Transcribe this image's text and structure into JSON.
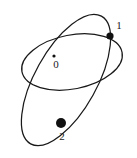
{
  "figure": {
    "background_color": "#ffffff",
    "stroke_color": "#191919",
    "dot_color": "#111111",
    "width": 137,
    "height": 158
  },
  "chart_data": {
    "type": "scatter",
    "title": "",
    "xlabel": "",
    "ylabel": "",
    "grid": false,
    "legend": false,
    "xlim": [
      0,
      137
    ],
    "ylim": [
      0,
      158
    ],
    "curves": [
      {
        "name": "tilted-ellipse",
        "shape": "ellipse",
        "cx": 66,
        "cy": 80,
        "rx": 73,
        "ry": 31,
        "rotation_deg": -61
      },
      {
        "name": "horizontal-ellipse",
        "shape": "ellipse",
        "cx": 72,
        "cy": 62,
        "rx": 51,
        "ry": 27,
        "rotation_deg": -11
      }
    ],
    "points": [
      {
        "label": "0",
        "x": 54,
        "y": 56,
        "radius": 1.6,
        "label_x": 56,
        "label_y": 65
      },
      {
        "label": "1",
        "x": 110,
        "y": 36,
        "radius": 3.6,
        "label_x": 119,
        "label_y": 26
      },
      {
        "label": "2",
        "x": 61,
        "y": 123,
        "radius": 5.0,
        "label_x": 62,
        "label_y": 137
      }
    ]
  }
}
